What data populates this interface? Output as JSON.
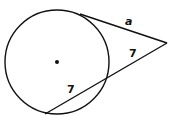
{
  "diagram": {
    "type": "circle-tangent-secant",
    "labels": {
      "tangent_segment": "a",
      "secant_external_segment": "7",
      "secant_internal_chord": "7"
    },
    "has_center_point": true
  }
}
